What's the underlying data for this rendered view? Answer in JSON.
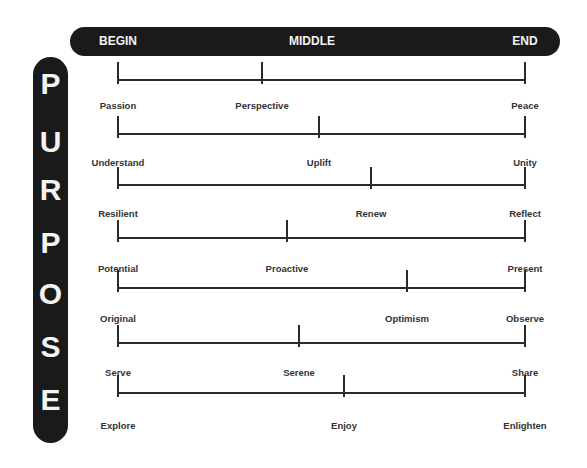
{
  "header": {
    "labels": [
      {
        "text": "BEGIN",
        "x": 118
      },
      {
        "text": "MIDDLE",
        "x": 312
      },
      {
        "text": "END",
        "x": 525
      }
    ]
  },
  "title": {
    "letters": [
      "P",
      "U",
      "R",
      "P",
      "O",
      "S",
      "E"
    ],
    "letter_y": [
      84,
      142,
      190,
      243,
      294,
      347,
      400
    ]
  },
  "scale": {
    "begin_x": 118,
    "end_x": 525
  },
  "rows": [
    {
      "begin": "Passion",
      "middle": "Perspective",
      "end": "Peace",
      "middle_x": 262,
      "line_y": 80,
      "label_y": 105
    },
    {
      "begin": "Understand",
      "middle": "Uplift",
      "end": "Unity",
      "middle_x": 319,
      "line_y": 134,
      "label_y": 162
    },
    {
      "begin": "Resilient",
      "middle": "Renew",
      "end": "Reflect",
      "middle_x": 371,
      "line_y": 185,
      "label_y": 213
    },
    {
      "begin": "Potential",
      "middle": "Proactive",
      "end": "Present",
      "middle_x": 287,
      "line_y": 238,
      "label_y": 268
    },
    {
      "begin": "Original",
      "middle": "Optimism",
      "end": "Observe",
      "middle_x": 407,
      "line_y": 288,
      "label_y": 318
    },
    {
      "begin": "Serve",
      "middle": "Serene",
      "end": "Share",
      "middle_x": 299,
      "line_y": 343,
      "label_y": 372
    },
    {
      "begin": "Explore",
      "middle": "Enjoy",
      "end": "Enlighten",
      "middle_x": 344,
      "line_y": 393,
      "label_y": 425
    }
  ],
  "colors": {
    "bar": "#1a1a1a",
    "line": "#2b2b2b",
    "text": "#333333",
    "bar_text": "#f2f2f2"
  }
}
